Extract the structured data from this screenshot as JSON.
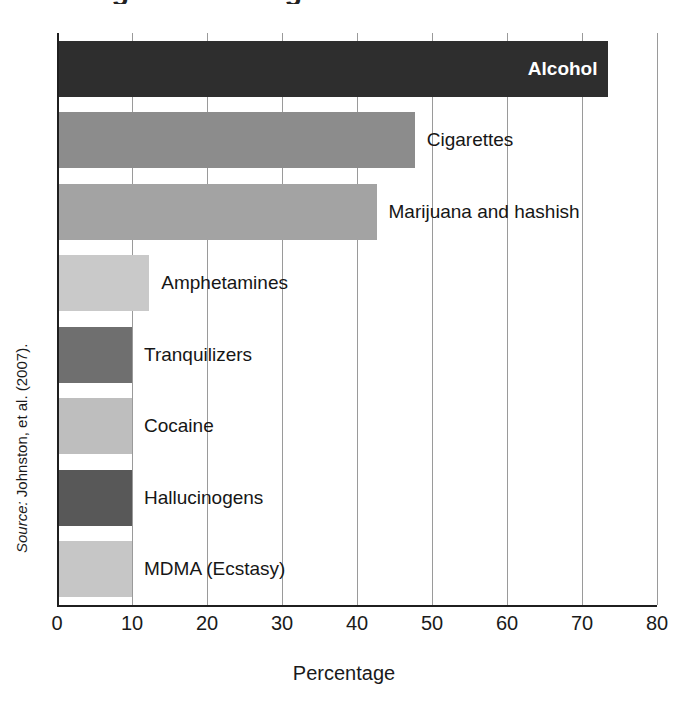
{
  "chart_data": {
    "type": "bar",
    "orientation": "horizontal",
    "title": "Drug Use Among",
    "xlabel": "Percentage",
    "ylabel": "",
    "xlim": [
      0,
      80
    ],
    "xticks": [
      0,
      10,
      20,
      30,
      40,
      50,
      60,
      70,
      80
    ],
    "xtick_labels": [
      "0",
      "10",
      "20",
      "30",
      "40",
      "50",
      "60",
      "70",
      "80"
    ],
    "grid": true,
    "legend": false,
    "categories": [
      "Alcohol",
      "Cigarettes",
      "Marijuana and hashish",
      "Amphetamines",
      "Tranquilizers",
      "Cocaine",
      "Hallucinogens",
      "MDMA (Ecstasy)"
    ],
    "values": [
      73.4,
      47.7,
      42.6,
      12.3,
      10.0,
      10.0,
      10.0,
      10.0
    ],
    "bar_colors": [
      "#2e2e2e",
      "#8c8c8c",
      "#a3a3a3",
      "#c9c9c9",
      "#6f6f6f",
      "#bebebe",
      "#585858",
      "#c6c6c6"
    ],
    "label_placement": [
      "inside",
      "outside",
      "outside",
      "outside",
      "outside",
      "outside",
      "outside",
      "outside"
    ]
  },
  "source": {
    "label": "Source:",
    "text": " Johnston, et al. (2007)."
  }
}
